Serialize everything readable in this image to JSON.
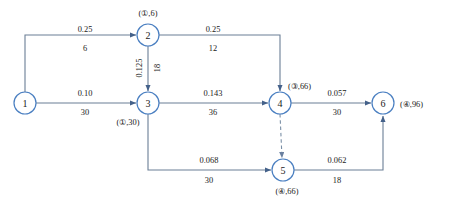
{
  "diagram": {
    "colors": {
      "node_stroke": "#4a7fc1",
      "node_fill": "#ffffff",
      "edge": "#6b7f96",
      "text": "#1a1a1a",
      "background": "#ffffff"
    },
    "nodes": [
      {
        "id": "1",
        "label": "1",
        "cx": 25,
        "cy": 103,
        "r": 11
      },
      {
        "id": "2",
        "label": "2",
        "cx": 148,
        "cy": 35,
        "r": 11
      },
      {
        "id": "3",
        "label": "3",
        "cx": 148,
        "cy": 103,
        "r": 11
      },
      {
        "id": "4",
        "label": "4",
        "cx": 280,
        "cy": 103,
        "r": 11
      },
      {
        "id": "5",
        "label": "5",
        "cx": 283,
        "cy": 170,
        "r": 11
      },
      {
        "id": "6",
        "label": "6",
        "cx": 383,
        "cy": 103,
        "r": 11
      }
    ],
    "node_annotations": [
      {
        "node": "2",
        "text": "(①,6)",
        "x": 148,
        "y": 13,
        "position": "above"
      },
      {
        "node": "3",
        "text": "(①,30)",
        "x": 128,
        "y": 122,
        "position": "below-left"
      },
      {
        "node": "4",
        "text": "(③,66)",
        "x": 302,
        "y": 86,
        "position": "right-above"
      },
      {
        "node": "5",
        "text": "(④,66)",
        "x": 287,
        "y": 191,
        "position": "below"
      },
      {
        "node": "6",
        "text": "(④,96)",
        "x": 412,
        "y": 104,
        "position": "right"
      }
    ],
    "edges": [
      {
        "id": "e12",
        "from": "1",
        "to": "2",
        "upper": "0.25",
        "lower": "6",
        "style": "solid",
        "label_x": 85,
        "upper_y": 30,
        "lower_y": 48
      },
      {
        "id": "e13",
        "from": "1",
        "to": "3",
        "upper": "0.10",
        "lower": "30",
        "style": "solid",
        "label_x": 85,
        "upper_y": 94,
        "lower_y": 112
      },
      {
        "id": "e23",
        "from": "2",
        "to": "3",
        "upper": "0.125",
        "lower": "18",
        "style": "solid",
        "label_x": 0,
        "upper_y": 0,
        "lower_y": 0,
        "orientation": "vertical"
      },
      {
        "id": "e24",
        "from": "2",
        "to": "4",
        "upper": "0.25",
        "lower": "12",
        "style": "solid",
        "label_x": 213,
        "upper_y": 30,
        "lower_y": 48
      },
      {
        "id": "e34",
        "from": "3",
        "to": "4",
        "upper": "0.143",
        "lower": "36",
        "style": "solid",
        "label_x": 213,
        "upper_y": 94,
        "lower_y": 112
      },
      {
        "id": "e45",
        "from": "4",
        "to": "5",
        "upper": "",
        "lower": "",
        "style": "dashed",
        "label_x": 0,
        "upper_y": 0,
        "lower_y": 0,
        "orientation": "vertical"
      },
      {
        "id": "e46",
        "from": "4",
        "to": "6",
        "upper": "0.057",
        "lower": "30",
        "style": "solid",
        "label_x": 337,
        "upper_y": 94,
        "lower_y": 112
      },
      {
        "id": "e35",
        "from": "3",
        "to": "5",
        "upper": "0.068",
        "lower": "30",
        "style": "solid",
        "label_x": 209,
        "upper_y": 160,
        "lower_y": 180
      },
      {
        "id": "e56",
        "from": "5",
        "to": "6",
        "upper": "0.062",
        "lower": "18",
        "style": "solid",
        "label_x": 337,
        "upper_y": 160,
        "lower_y": 180
      }
    ],
    "vertical_edge_labels": {
      "e23_upper": "0.125",
      "e23_lower": "18"
    }
  }
}
